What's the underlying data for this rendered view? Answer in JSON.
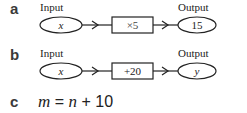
{
  "diagrams": [
    {
      "label": "a",
      "input_caption": "Input",
      "input_value": "x",
      "operation": "×5",
      "output_caption": "Output",
      "output_value": "15"
    },
    {
      "label": "b",
      "input_caption": "Input",
      "input_value": "x",
      "operation": "+20",
      "output_caption": "Output",
      "output_value": "y"
    }
  ],
  "equation": {
    "label": "c",
    "lhs": "m",
    "equals": " = ",
    "var": "n",
    "rest": " + 10"
  },
  "colors": {
    "stroke": "#222222",
    "label": "#3a3a3a"
  }
}
